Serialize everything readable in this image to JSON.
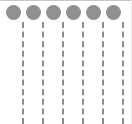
{
  "diagram": {
    "canvas": {
      "width": 132,
      "height": 124,
      "background_color": "#ffffff",
      "top_border_color": "#c8c8c8",
      "right_border_color": "#e8e8e8"
    },
    "nodes": {
      "count": 6,
      "shape": "circle",
      "fill_color": "#909090",
      "diameter": 15,
      "center_y": 12,
      "centers_x": [
        13,
        33,
        53,
        73,
        93,
        113
      ],
      "labels": [
        "node-1",
        "node-2",
        "node-3",
        "node-4",
        "node-5",
        "node-6"
      ]
    },
    "connectors": {
      "count": 6,
      "style": "dashed",
      "color": "#8c8c8c",
      "thickness": 2,
      "dash_length": 7,
      "gap_length": 4,
      "top_y": 22,
      "bottom_y": 124,
      "positions_x": [
        22,
        42,
        62,
        82,
        102,
        122
      ],
      "labels": [
        "line-1",
        "line-2",
        "line-3",
        "line-4",
        "line-5",
        "line-6"
      ]
    }
  }
}
